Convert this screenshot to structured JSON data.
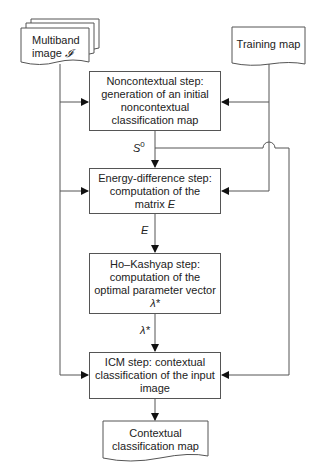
{
  "inputs": {
    "multiband": {
      "line1": "Multiband",
      "line2": "image",
      "symbol": "𝓘"
    },
    "training": {
      "label": "Training map"
    }
  },
  "steps": [
    {
      "id": "noncontextual",
      "lines": [
        "Noncontextual step:",
        "generation of an initial",
        "noncontextual",
        "classification map"
      ]
    },
    {
      "id": "energy",
      "lines": [
        "Energy-difference step:",
        "computation of the"
      ],
      "last_prefix": "matrix ",
      "last_symbol": "E"
    },
    {
      "id": "hokashyap",
      "lines": [
        "Ho–Kashyap step:",
        "computation of the",
        "optimal parameter vector"
      ],
      "last_symbol": "λ*"
    },
    {
      "id": "icm",
      "lines": [
        "ICM step: contextual",
        "classification of the input",
        "image"
      ]
    }
  ],
  "edge_labels": {
    "s0_base": "S",
    "s0_sup": "0",
    "e": "E",
    "lambda": "λ*"
  },
  "output": {
    "line1": "Contextual",
    "line2": "classification map"
  },
  "colors": {
    "stroke": "#555555",
    "text": "#222222",
    "background": "#ffffff"
  }
}
